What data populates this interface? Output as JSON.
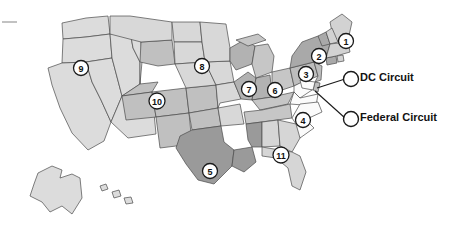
{
  "figure": {
    "type": "map",
    "background_color": "#ffffff",
    "outline_color": "#4a4a4a"
  },
  "circuits": [
    {
      "id": "1",
      "label": "1",
      "x": 346,
      "y": 41,
      "fill": "#d2d2d2"
    },
    {
      "id": "2",
      "label": "2",
      "x": 319,
      "y": 56,
      "fill": "#a9a9a9"
    },
    {
      "id": "3",
      "label": "3",
      "x": 306,
      "y": 74,
      "fill": "#bdbdbd"
    },
    {
      "id": "4",
      "label": "4",
      "x": 303,
      "y": 120,
      "fill": "#fbfbfb"
    },
    {
      "id": "5",
      "label": "5",
      "x": 210,
      "y": 171,
      "fill": "#9a9a9a"
    },
    {
      "id": "6",
      "label": "6",
      "x": 275,
      "y": 90,
      "fill": "#c6c6c6"
    },
    {
      "id": "7",
      "label": "7",
      "x": 249,
      "y": 89,
      "fill": "#b2b2b2"
    },
    {
      "id": "8",
      "label": "8",
      "x": 202,
      "y": 66,
      "fill": "#d8d8d8"
    },
    {
      "id": "9",
      "label": "9",
      "x": 81,
      "y": 68,
      "fill": "#dcdcdc"
    },
    {
      "id": "10",
      "label": "10",
      "x": 157,
      "y": 101,
      "fill": "#c0c0c0"
    },
    {
      "id": "11",
      "label": "11",
      "x": 281,
      "y": 155,
      "fill": "#d6d6d6"
    }
  ],
  "legend": {
    "items": [
      {
        "id": "dc",
        "label": "DC Circuit",
        "marker_x": 351,
        "marker_y": 79
      },
      {
        "id": "federal",
        "label": "Federal Circuit",
        "marker_x": 351,
        "marker_y": 119
      }
    ]
  }
}
